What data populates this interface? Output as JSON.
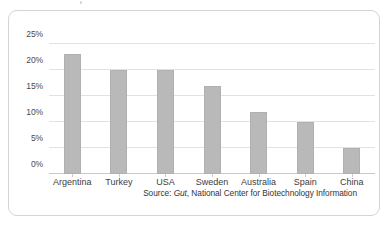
{
  "chart_data": {
    "type": "bar",
    "title": "",
    "subtitle": "",
    "xlabel": "",
    "ylabel": "",
    "ylim": [
      0,
      25
    ],
    "ytick_step": 5,
    "ytick_labels": [
      "0%",
      "5%",
      "10%",
      "15%",
      "20%",
      "25%"
    ],
    "ytick_values": [
      0,
      5,
      10,
      15,
      20,
      25
    ],
    "categories": [
      "Argentina",
      "Turkey",
      "USA",
      "Sweden",
      "Australia",
      "Spain",
      "China"
    ],
    "values": [
      23,
      20,
      20,
      17,
      12,
      10,
      5
    ],
    "value_labels": [
      "23%",
      "20%",
      "20%",
      "17%",
      "12%",
      "10%",
      "5%"
    ],
    "grid": true,
    "grid_axis": "y",
    "legend": false,
    "legend_position": "none",
    "bar_color": "#b9b9b9",
    "bar_border_color": "#b0b0b0",
    "gridline_color": "#e2e2e2",
    "axis_color": "#c9c9c9",
    "frame_color": "#d4d4d4",
    "background": "#ffffff",
    "text_color": "#3d3d3d"
  },
  "source": {
    "prefix": "Source: ",
    "publication": "Gut",
    "suffix": ", National Center for Biotechnology Information",
    "full_text": "Source: Gut, National Center for Biotechnology Information"
  }
}
